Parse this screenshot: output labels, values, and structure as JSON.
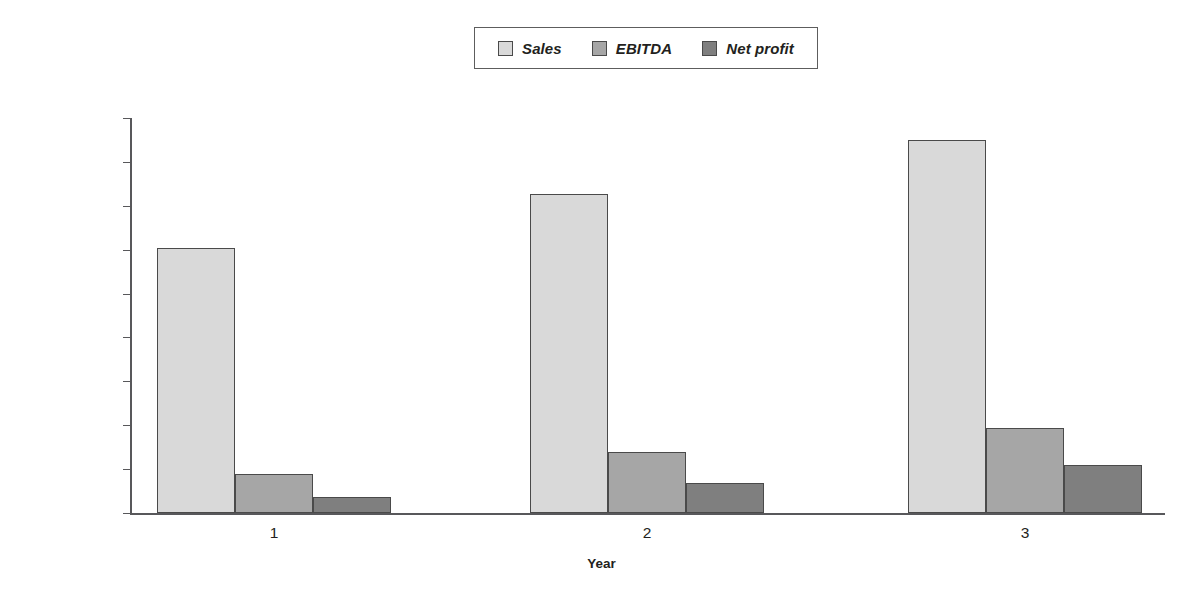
{
  "chart_data": {
    "type": "bar",
    "title": "",
    "subtitle": "",
    "xlabel": "Year",
    "ylabel": "",
    "categories": [
      "1",
      "2",
      "3"
    ],
    "series": [
      {
        "name": "Sales",
        "values": [
          604000,
          727000,
          850000
        ],
        "color": "#d9d9d9"
      },
      {
        "name": "EBITDA",
        "values": [
          89000,
          139000,
          194000
        ],
        "color": "#a6a6a6"
      },
      {
        "name": "Net profit",
        "values": [
          36000,
          68000,
          109000
        ],
        "color": "#7f7f7f"
      }
    ],
    "ylim": [
      0,
      900000
    ],
    "ytick_values": [
      0,
      100000,
      200000,
      300000,
      400000,
      500000,
      600000,
      700000,
      800000,
      900000
    ],
    "ytick_labels": [
      "$0",
      "$100,000",
      "$200,000",
      "$300,000",
      "$400,000",
      "$500,000",
      "$600,000",
      "$700,000",
      "$800,000",
      "$900,000"
    ],
    "grid": false,
    "legend_position": "top-center",
    "legend_entries": [
      "Sales",
      "EBITDA",
      "Net profit"
    ]
  },
  "legend": {
    "entries": [
      {
        "label": "Sales",
        "swatch_color": "#d9d9d9"
      },
      {
        "label": "EBITDA",
        "swatch_color": "#a6a6a6"
      },
      {
        "label": "Net profit",
        "swatch_color": "#7f7f7f"
      }
    ]
  },
  "axes": {
    "x_title": "Year",
    "x_labels": [
      "1",
      "2",
      "3"
    ],
    "y_labels": [
      "$900,000",
      "$800,000",
      "$700,000",
      "$600,000",
      "$500,000",
      "$400,000",
      "$300,000",
      "$200,000",
      "$100,000",
      "$0"
    ]
  },
  "colors": {
    "sales": "#d9d9d9",
    "ebitda": "#a6a6a6",
    "net_profit": "#7f7f7f",
    "axis": "#58585b",
    "bar_outline": "#4a4a4a",
    "text": "#231f20",
    "background": "#ffffff"
  }
}
